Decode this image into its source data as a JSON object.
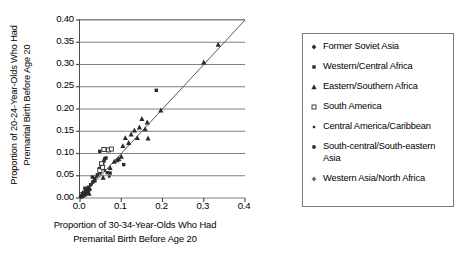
{
  "chart_data": {
    "type": "scatter",
    "title": "",
    "xlabel_line1": "Proportion of 30-34-Year-Olds Who Had",
    "xlabel_line2": "Premarital Birth Before Age 20",
    "ylabel_line1": "Proportion of 20-24-Year-Olds Who Had",
    "ylabel_line2": "Premarital Birth Before Age 20",
    "xlim": [
      0.0,
      0.4
    ],
    "ylim": [
      0.0,
      0.4
    ],
    "xticks": [
      "0.0",
      "0.1",
      "0.2",
      "0.3",
      "0.4"
    ],
    "xtick_values": [
      0.0,
      0.1,
      0.2,
      0.3,
      0.4
    ],
    "yticks": [
      "0.00",
      "0.05",
      "0.10",
      "0.15",
      "0.20",
      "0.25",
      "0.30",
      "0.35",
      "0.40"
    ],
    "ytick_values": [
      0.0,
      0.05,
      0.1,
      0.15,
      0.2,
      0.25,
      0.3,
      0.35,
      0.4
    ],
    "grid": "horizontal",
    "grid_color": "#808080",
    "reference_line": {
      "name": "identity-line",
      "from": [
        0.0,
        0.0
      ],
      "to": [
        0.4,
        0.4
      ],
      "color": "#595959"
    },
    "legend_position": "right-outside",
    "marker_color": "#2b2b2b",
    "series": [
      {
        "name": "Former Soviet Asia",
        "marker": "diamond",
        "points": [
          [
            0.003,
            0.004
          ],
          [
            0.005,
            0.003
          ],
          [
            0.006,
            0.008
          ],
          [
            0.009,
            0.006
          ],
          [
            0.011,
            0.012
          ],
          [
            0.013,
            0.009
          ],
          [
            0.016,
            0.018
          ],
          [
            0.019,
            0.014
          ]
        ]
      },
      {
        "name": "Western/Central Africa",
        "marker": "square",
        "points": [
          [
            0.02,
            0.024
          ],
          [
            0.026,
            0.03
          ],
          [
            0.031,
            0.036
          ],
          [
            0.036,
            0.044
          ],
          [
            0.042,
            0.052
          ],
          [
            0.047,
            0.066
          ],
          [
            0.052,
            0.072
          ],
          [
            0.055,
            0.078
          ],
          [
            0.058,
            0.083
          ],
          [
            0.06,
            0.088
          ],
          [
            0.063,
            0.09
          ],
          [
            0.048,
            0.105
          ],
          [
            0.066,
            0.057
          ],
          [
            0.073,
            0.056
          ],
          [
            0.106,
            0.075
          ],
          [
            0.185,
            0.242
          ],
          [
            0.013,
            0.017
          ],
          [
            0.03,
            0.047
          ]
        ]
      },
      {
        "name": "Eastern/Southern Africa",
        "marker": "triangle",
        "points": [
          [
            0.022,
            0.01
          ],
          [
            0.035,
            0.04
          ],
          [
            0.056,
            0.046
          ],
          [
            0.073,
            0.068
          ],
          [
            0.083,
            0.082
          ],
          [
            0.09,
            0.085
          ],
          [
            0.094,
            0.088
          ],
          [
            0.1,
            0.093
          ],
          [
            0.104,
            0.117
          ],
          [
            0.11,
            0.135
          ],
          [
            0.118,
            0.124
          ],
          [
            0.124,
            0.143
          ],
          [
            0.132,
            0.152
          ],
          [
            0.139,
            0.135
          ],
          [
            0.144,
            0.159
          ],
          [
            0.15,
            0.178
          ],
          [
            0.158,
            0.155
          ],
          [
            0.163,
            0.17
          ],
          [
            0.196,
            0.197
          ],
          [
            0.3,
            0.305
          ],
          [
            0.335,
            0.345
          ],
          [
            0.165,
            0.134
          ]
        ]
      },
      {
        "name": "South America",
        "marker": "open-square",
        "points": [
          [
            0.052,
            0.077
          ],
          [
            0.058,
            0.109
          ],
          [
            0.069,
            0.108
          ],
          [
            0.076,
            0.11
          ],
          [
            0.048,
            0.062
          ],
          [
            0.055,
            0.069
          ]
        ]
      },
      {
        "name": "Central America/Caribbean",
        "marker": "small-square",
        "points": [
          [
            0.032,
            0.038
          ],
          [
            0.04,
            0.048
          ],
          [
            0.049,
            0.055
          ],
          [
            0.06,
            0.062
          ],
          [
            0.071,
            0.048
          ],
          [
            0.022,
            0.025
          ]
        ]
      },
      {
        "name": "South-central/South-eastern Asia",
        "marker": "dot",
        "points": [
          [
            0.004,
            0.005
          ],
          [
            0.007,
            0.009
          ],
          [
            0.01,
            0.011
          ],
          [
            0.014,
            0.016
          ],
          [
            0.017,
            0.013
          ],
          [
            0.021,
            0.022
          ],
          [
            0.024,
            0.019
          ],
          [
            0.012,
            0.022
          ],
          [
            0.008,
            0.004
          ]
        ]
      },
      {
        "name": "Western Asia/North Africa",
        "marker": "plus",
        "points": [
          [
            0.002,
            0.002
          ],
          [
            0.005,
            0.006
          ],
          [
            0.008,
            0.005
          ],
          [
            0.011,
            0.01
          ],
          [
            0.015,
            0.008
          ],
          [
            0.018,
            0.02
          ],
          [
            0.006,
            0.012
          ]
        ]
      }
    ]
  }
}
